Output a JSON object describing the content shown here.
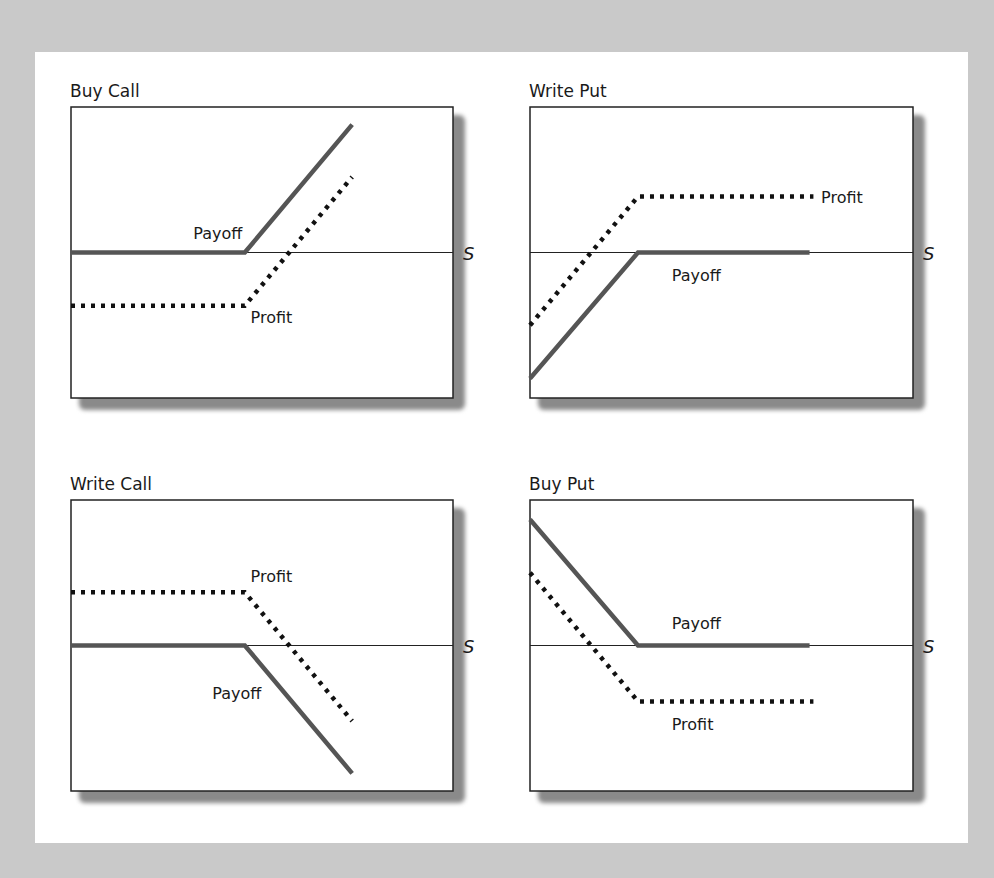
{
  "chart_data": [
    {
      "type": "line",
      "title": "Buy Call",
      "xlabel": "S",
      "ylabel": "",
      "xlim": [
        0,
        100
      ],
      "ylim": [
        -52,
        52
      ],
      "grid": false,
      "series": [
        {
          "name": "Payoff",
          "style": "solid",
          "x": [
            0,
            45.5,
            73.6
          ],
          "y": [
            0,
            0,
            45.7
          ]
        },
        {
          "name": "Profit",
          "style": "dotted",
          "x": [
            0,
            45.5,
            73.6
          ],
          "y": [
            -19,
            -19,
            27
          ]
        }
      ],
      "annotations": [
        {
          "text": "Payoff",
          "x": 32,
          "y": 7
        },
        {
          "text": "Profit",
          "x": 47,
          "y": -23
        }
      ]
    },
    {
      "type": "line",
      "title": "Write Put",
      "xlabel": "S",
      "ylabel": "",
      "xlim": [
        0,
        100
      ],
      "ylim": [
        -52,
        52
      ],
      "grid": false,
      "series": [
        {
          "name": "Payoff",
          "style": "solid",
          "x": [
            0,
            28.2,
            73
          ],
          "y": [
            -45,
            0,
            0
          ]
        },
        {
          "name": "Profit",
          "style": "dotted",
          "x": [
            0,
            28.2,
            74
          ],
          "y": [
            -26,
            20,
            20
          ]
        }
      ],
      "annotations": [
        {
          "text": "Profit",
          "x": 76,
          "y": 20
        },
        {
          "text": "Payoff",
          "x": 37,
          "y": -8
        }
      ]
    },
    {
      "type": "line",
      "title": "Write Call",
      "xlabel": "S",
      "ylabel": "",
      "xlim": [
        0,
        100
      ],
      "ylim": [
        -52,
        52
      ],
      "grid": false,
      "series": [
        {
          "name": "Payoff",
          "style": "solid",
          "x": [
            0,
            45.5,
            73.6
          ],
          "y": [
            0,
            0,
            -45.7
          ]
        },
        {
          "name": "Profit",
          "style": "dotted",
          "x": [
            0,
            45.5,
            73.6
          ],
          "y": [
            19,
            19,
            -27
          ]
        }
      ],
      "annotations": [
        {
          "text": "Profit",
          "x": 47,
          "y": 25
        },
        {
          "text": "Payoff",
          "x": 37,
          "y": -17
        }
      ]
    },
    {
      "type": "line",
      "title": "Buy Put",
      "xlabel": "S",
      "ylabel": "",
      "xlim": [
        0,
        100
      ],
      "ylim": [
        -52,
        52
      ],
      "grid": false,
      "series": [
        {
          "name": "Payoff",
          "style": "solid",
          "x": [
            0,
            28.2,
            73
          ],
          "y": [
            45,
            0,
            0
          ]
        },
        {
          "name": "Profit",
          "style": "dotted",
          "x": [
            0,
            28.2,
            74
          ],
          "y": [
            26,
            -20,
            -20
          ]
        }
      ],
      "annotations": [
        {
          "text": "Payoff",
          "x": 37,
          "y": 8
        },
        {
          "text": "Profit",
          "x": 37,
          "y": -28
        }
      ]
    }
  ]
}
